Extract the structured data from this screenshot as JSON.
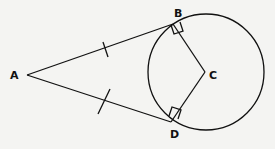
{
  "diagram": {
    "points": {
      "A": {
        "label": "A",
        "x": 27,
        "y": 75
      },
      "B": {
        "label": "B",
        "x": 173,
        "y": 24
      },
      "C": {
        "label": "C",
        "x": 205,
        "y": 72
      },
      "D": {
        "label": "D",
        "x": 171,
        "y": 122
      }
    },
    "circle": {
      "cx": 206,
      "cy": 72,
      "r": 58
    },
    "segments": [
      "AB",
      "AD",
      "BC",
      "DC"
    ],
    "equal_marks": [
      "AB",
      "AD"
    ],
    "right_angles": [
      "ABC",
      "ADC"
    ],
    "colors": {
      "stroke": "#111111",
      "background": "#f4f4f2"
    }
  }
}
